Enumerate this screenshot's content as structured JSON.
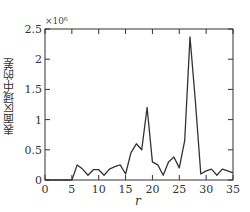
{
  "chart_data": {
    "type": "line",
    "title": "",
    "xlabel": "r",
    "ylabel": "表面区域中的差",
    "y_multiplier": "×10⁶",
    "xlim": [
      0,
      35
    ],
    "ylim": [
      0,
      2.5
    ],
    "x_ticks": [
      "0",
      "5",
      "10",
      "15",
      "20",
      "25",
      "30",
      "35"
    ],
    "y_ticks": [
      "0",
      "0.5",
      "1",
      "1.5",
      "2",
      "2.5"
    ],
    "grid": false,
    "legend": null,
    "series": [
      {
        "name": "difference",
        "color": "#333333",
        "x": [
          0,
          1,
          2,
          3,
          4,
          5,
          5,
          6,
          7,
          8,
          9,
          10,
          11,
          12,
          13,
          14,
          15,
          16,
          17,
          18,
          19,
          20,
          21,
          22,
          23,
          24,
          25,
          26,
          27,
          28,
          29,
          30,
          31,
          32,
          33,
          34,
          35
        ],
        "values": [
          0,
          0,
          0,
          0,
          0,
          0,
          0.0,
          0.25,
          0.18,
          0.08,
          0.17,
          0.17,
          0.08,
          0.18,
          0.22,
          0.25,
          0.1,
          0.45,
          0.6,
          0.5,
          1.2,
          0.3,
          0.25,
          0.08,
          0.3,
          0.38,
          0.2,
          0.65,
          2.37,
          1.3,
          0.1,
          0.15,
          0.18,
          0.08,
          0.18,
          0.15,
          0.12
        ]
      }
    ]
  }
}
